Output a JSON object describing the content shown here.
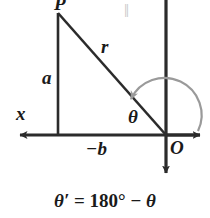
{
  "figure": {
    "title_equation": {
      "lhs": "θ′",
      "eq": "=",
      "rhs_number": "180°",
      "minus": "−",
      "rhs_symbol": "θ",
      "full_text": "θ′ = 180° − θ"
    },
    "labels": {
      "point_P": "P",
      "hypotenuse_r": "r",
      "vertical_leg_a": "a",
      "axis_x": "x",
      "angle_theta": "θ",
      "horizontal_leg_neg_b": "−b",
      "origin_O": "O",
      "parallel_mark": "‖"
    },
    "colors": {
      "background": "#ffffff",
      "ink": "#1a1a1a",
      "line": "#2b2b2b",
      "arc_arrow": "#9a9a9a",
      "parallel_mark": "#c8c8c8"
    },
    "geometry": {
      "origin": {
        "x": 166,
        "y": 135
      },
      "point_P": {
        "x": 58,
        "y": 13
      },
      "foot_of_perpendicular": {
        "x": 58,
        "y": 135
      },
      "x_axis_left_tip": {
        "x": 14,
        "y": 135
      },
      "x_axis_right_tip": {
        "x": 206,
        "y": 135
      },
      "y_axis_top": {
        "x": 166,
        "y": 0
      },
      "y_axis_bottom_tip": {
        "x": 166,
        "y": 180
      },
      "arc_start": {
        "x": 196,
        "y": 135
      },
      "arc_end": {
        "x": 125,
        "y": 95
      },
      "arc_radius": 30
    }
  }
}
